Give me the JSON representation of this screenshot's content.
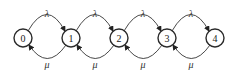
{
  "diagram": {
    "type": "birth-death state transition diagram",
    "nodes": [
      {
        "id": "0",
        "label": "0",
        "cx": 23,
        "cy": 38
      },
      {
        "id": "1",
        "label": "1",
        "cx": 71,
        "cy": 38
      },
      {
        "id": "2",
        "label": "2",
        "cx": 119,
        "cy": 38
      },
      {
        "id": "3",
        "label": "3",
        "cx": 167,
        "cy": 38
      },
      {
        "id": "4",
        "label": "4",
        "cx": 215,
        "cy": 38
      }
    ],
    "forward_edges": [
      {
        "from": "0",
        "to": "1",
        "label": "λ"
      },
      {
        "from": "1",
        "to": "2",
        "label": "λ"
      },
      {
        "from": "2",
        "to": "3",
        "label": "λ"
      },
      {
        "from": "3",
        "to": "4",
        "label": "λ"
      }
    ],
    "backward_edges": [
      {
        "from": "1",
        "to": "0",
        "label": "μ"
      },
      {
        "from": "2",
        "to": "1",
        "label": "μ"
      },
      {
        "from": "3",
        "to": "2",
        "label": "μ"
      },
      {
        "from": "4",
        "to": "3",
        "label": "μ"
      }
    ],
    "colors": {
      "stroke": "#2a2a2a",
      "background": "#ffffff"
    }
  }
}
